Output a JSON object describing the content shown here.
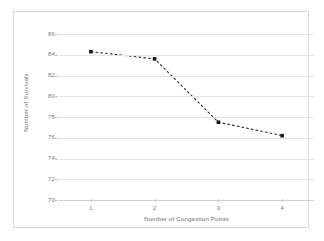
{
  "chart_data": {
    "type": "line",
    "title": "",
    "xlabel": "Number of Congestion Points",
    "ylabel": "Number of Survivals",
    "categories": [
      "1",
      "2",
      "3",
      "4"
    ],
    "x": [
      1,
      2,
      3,
      4
    ],
    "values": [
      84.3,
      83.6,
      77.5,
      76.2
    ],
    "series": [
      {
        "name": "Number of Survivals",
        "values": [
          84.3,
          83.6,
          77.5,
          76.2
        ]
      }
    ],
    "ylim": [
      70,
      86
    ],
    "ytick_labels": [
      "86",
      "84",
      "82",
      "80",
      "78",
      "76",
      "74",
      "72",
      "70"
    ],
    "ytick_values": [
      86,
      84,
      82,
      80,
      78,
      76,
      74,
      72,
      70
    ],
    "xtick_labels": [
      "1",
      "2",
      "3",
      "4"
    ],
    "grid": "horizontal",
    "legend": "none",
    "line_style": "dashed",
    "marker": "square",
    "colors": {
      "line": "#2f2f2f",
      "marker": "#1a1a1a",
      "gridline": "#e4e4e4",
      "axis_text": "#7b7b7b",
      "frame": "#d9d9d9",
      "background": "#ffffff"
    }
  }
}
